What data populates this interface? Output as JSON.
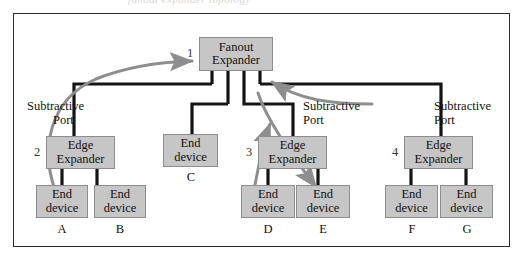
{
  "figure": {
    "top_bleed_text": "fanout expander topology",
    "nodes": [
      {
        "id": "fanout",
        "index": "1",
        "line1": "Fanout",
        "line2": "Expander",
        "type": "fanout-expander"
      },
      {
        "id": "edge2",
        "index": "2",
        "line1": "Edge",
        "line2": "Expander",
        "type": "edge-expander"
      },
      {
        "id": "edge3",
        "index": "3",
        "line1": "Edge",
        "line2": "Expander",
        "type": "edge-expander"
      },
      {
        "id": "edge4",
        "index": "4",
        "line1": "Edge",
        "line2": "Expander",
        "type": "edge-expander"
      }
    ],
    "end_devices": [
      {
        "id": "devA",
        "line1": "End",
        "line2": "device",
        "label": "A"
      },
      {
        "id": "devB",
        "line1": "End",
        "line2": "device",
        "label": "B"
      },
      {
        "id": "devC",
        "line1": "End",
        "line2": "device",
        "label": "C"
      },
      {
        "id": "devD",
        "line1": "End",
        "line2": "device",
        "label": "D"
      },
      {
        "id": "devE",
        "line1": "End",
        "line2": "device",
        "label": "E"
      },
      {
        "id": "devF",
        "line1": "End",
        "line2": "device",
        "label": "F"
      },
      {
        "id": "devG",
        "line1": "End",
        "line2": "device",
        "label": "G"
      }
    ],
    "annotations": [
      {
        "id": "sub-left",
        "line1": "Subtractive",
        "line2": "Port"
      },
      {
        "id": "sub-middle",
        "line1": "Subtractive",
        "line2": "Port"
      },
      {
        "id": "sub-right",
        "line1": "Subtractive",
        "line2": "Port"
      }
    ],
    "colors": {
      "node_fill": "#c6c6c6",
      "node_stroke": "#8d8d8d",
      "wire": "#141414",
      "arrow": "#8e8e8e",
      "frame": "#2a2a2a",
      "page": "#ffffff"
    }
  }
}
